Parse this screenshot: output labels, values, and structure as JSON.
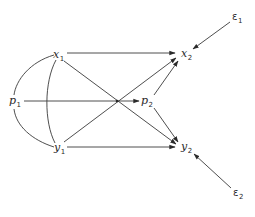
{
  "diagram": {
    "type": "path-diagram",
    "nodes": [
      {
        "id": "x1",
        "base": "x",
        "sub": "1",
        "role": "exogenous"
      },
      {
        "id": "y1",
        "base": "y",
        "sub": "1",
        "role": "exogenous"
      },
      {
        "id": "p1",
        "base": "p",
        "sub": "1",
        "role": "exogenous"
      },
      {
        "id": "x2",
        "base": "x",
        "sub": "2",
        "role": "endogenous"
      },
      {
        "id": "y2",
        "base": "y",
        "sub": "2",
        "role": "endogenous"
      },
      {
        "id": "p2",
        "base": "p",
        "sub": "2",
        "role": "endogenous"
      },
      {
        "id": "e1",
        "base": "ε",
        "sub": "1",
        "role": "error"
      },
      {
        "id": "e2",
        "base": "ε",
        "sub": "2",
        "role": "error"
      }
    ],
    "directed_edges": [
      {
        "from": "x1",
        "to": "x2"
      },
      {
        "from": "x1",
        "to": "y2"
      },
      {
        "from": "y1",
        "to": "x2"
      },
      {
        "from": "y1",
        "to": "y2"
      },
      {
        "from": "p1",
        "to": "p2"
      },
      {
        "from": "p2",
        "to": "x2"
      },
      {
        "from": "p2",
        "to": "y2"
      },
      {
        "from": "e1",
        "to": "x2"
      },
      {
        "from": "e2",
        "to": "y2"
      }
    ],
    "correlations": [
      {
        "a": "x1",
        "b": "p1"
      },
      {
        "a": "p1",
        "b": "y1"
      },
      {
        "a": "x1",
        "b": "y1"
      }
    ]
  }
}
